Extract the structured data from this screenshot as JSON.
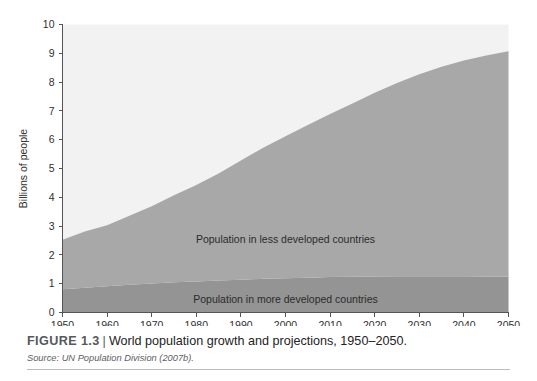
{
  "figure": {
    "label": "FIGURE 1.3",
    "separator": "|",
    "title": "World population growth and projections, 1950–2050.",
    "source_label": "Source:",
    "source_text": "UN Population Division (2007b)."
  },
  "colors": {
    "plot_background": "#f2f2f2",
    "less_developed": "#a8a8a8",
    "more_developed": "#949494",
    "axis": "#555555",
    "text": "#2f2f2f",
    "page_background": "#ffffff",
    "caption_rule": "#b9bcc0"
  },
  "chart_data": {
    "type": "area",
    "stacked": true,
    "title": "World population growth and projections, 1950–2050",
    "xlabel": "",
    "ylabel": "Billions of people",
    "xlim": [
      1950,
      2050
    ],
    "ylim": [
      0,
      10
    ],
    "grid": false,
    "legend_position": "inline-annotations",
    "x": [
      1950,
      1955,
      1960,
      1965,
      1970,
      1975,
      1980,
      1985,
      1990,
      1995,
      2000,
      2005,
      2010,
      2015,
      2020,
      2025,
      2030,
      2035,
      2040,
      2045,
      2050
    ],
    "xticks": [
      1950,
      1960,
      1970,
      1980,
      1990,
      2000,
      2010,
      2020,
      2030,
      2040,
      2050
    ],
    "xtick_labels": [
      "1950",
      "1960",
      "1970",
      "1980",
      "1990",
      "2000",
      "2010",
      "2020",
      "2030",
      "2040",
      "2050"
    ],
    "yticks": [
      0,
      1,
      2,
      3,
      4,
      5,
      6,
      7,
      8,
      9,
      10
    ],
    "ytick_labels": [
      "0",
      "1",
      "2",
      "3",
      "4",
      "5",
      "6",
      "7",
      "8",
      "9",
      "10"
    ],
    "series": [
      {
        "name": "Population in more developed countries",
        "color": "#949494",
        "annotation": "Population in more developed countries",
        "annotation_x": 2000,
        "annotation_y": 0.45,
        "values": [
          0.81,
          0.86,
          0.91,
          0.96,
          1.01,
          1.05,
          1.08,
          1.11,
          1.14,
          1.17,
          1.19,
          1.21,
          1.23,
          1.24,
          1.25,
          1.26,
          1.26,
          1.26,
          1.26,
          1.25,
          1.25
        ]
      },
      {
        "name": "Population in less developed countries",
        "color": "#a8a8a8",
        "annotation": "Population in less developed countries",
        "annotation_x": 2000,
        "annotation_y": 2.55,
        "values": [
          1.72,
          1.95,
          2.12,
          2.4,
          2.68,
          3.02,
          3.35,
          3.72,
          4.14,
          4.55,
          4.93,
          5.3,
          5.66,
          6.02,
          6.38,
          6.71,
          7.01,
          7.27,
          7.49,
          7.67,
          7.82
        ]
      }
    ],
    "totals": [
      2.53,
      2.81,
      3.03,
      3.36,
      3.69,
      4.07,
      4.43,
      4.83,
      5.28,
      5.72,
      6.12,
      6.51,
      6.89,
      7.26,
      7.63,
      7.97,
      8.27,
      8.53,
      8.75,
      8.92,
      9.07
    ]
  }
}
